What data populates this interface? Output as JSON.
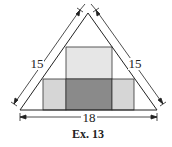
{
  "figure": {
    "caption": "Ex. 13",
    "dimensions": {
      "left_side": "15",
      "right_side": "15",
      "base": "18"
    },
    "shapes": {
      "triangle": "isosceles triangle",
      "top_square": {
        "fill": "#e6e6e6"
      },
      "bottom_left_rect": {
        "fill": "#d6d6d6"
      },
      "bottom_center_square": {
        "fill": "#8a8a8a"
      },
      "bottom_right_rect": {
        "fill": "#d6d6d6"
      }
    },
    "colors": {
      "stroke": "#222222",
      "background": "#ffffff"
    }
  }
}
